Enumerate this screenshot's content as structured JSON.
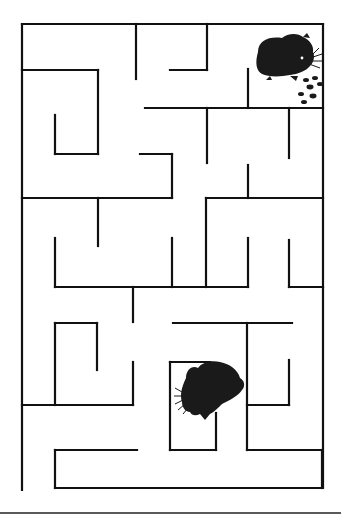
{
  "puzzle": {
    "type": "maze",
    "title": "",
    "wall_color": "#111111",
    "background": "#ffffff",
    "characters": [
      {
        "name": "hamster-with-food",
        "position": "top-right",
        "icon": "hamster-icon"
      },
      {
        "name": "hamster-seeking",
        "position": "bottom-center",
        "icon": "hamster-icon"
      }
    ],
    "food": {
      "name": "food-pellets",
      "icon": "food-pellets-icon",
      "count": 7
    }
  },
  "walls": [
    [
      22,
      24,
      323,
      24
    ],
    [
      22,
      24,
      22,
      490
    ],
    [
      323,
      24,
      323,
      488
    ],
    [
      136,
      24,
      136,
      79
    ],
    [
      207,
      24,
      207,
      70
    ],
    [
      170,
      70,
      207,
      70
    ],
    [
      22,
      70,
      98,
      70
    ],
    [
      98,
      70,
      98,
      154
    ],
    [
      55,
      115,
      55,
      154
    ],
    [
      55,
      154,
      98,
      154
    ],
    [
      145,
      108,
      323,
      108
    ],
    [
      248,
      69,
      248,
      108
    ],
    [
      207,
      108,
      207,
      163
    ],
    [
      289,
      108,
      289,
      158
    ],
    [
      140,
      154,
      172,
      154
    ],
    [
      172,
      154,
      172,
      198
    ],
    [
      248,
      165,
      248,
      198
    ],
    [
      22,
      198,
      172,
      198
    ],
    [
      98,
      198,
      98,
      246
    ],
    [
      206,
      198,
      323,
      198
    ],
    [
      206,
      198,
      206,
      287
    ],
    [
      55,
      238,
      55,
      287
    ],
    [
      55,
      287,
      248,
      287
    ],
    [
      172,
      238,
      172,
      287
    ],
    [
      248,
      238,
      248,
      287
    ],
    [
      289,
      240,
      289,
      287
    ],
    [
      289,
      287,
      323,
      287
    ],
    [
      133,
      287,
      133,
      322
    ],
    [
      55,
      323,
      97,
      323
    ],
    [
      55,
      323,
      55,
      405
    ],
    [
      97,
      323,
      97,
      370
    ],
    [
      133,
      362,
      133,
      405
    ],
    [
      22,
      405,
      133,
      405
    ],
    [
      173,
      323,
      292,
      323
    ],
    [
      247,
      323,
      247,
      450
    ],
    [
      247,
      405,
      289,
      405
    ],
    [
      289,
      360,
      289,
      405
    ],
    [
      170,
      362,
      210,
      362
    ],
    [
      170,
      362,
      170,
      450
    ],
    [
      170,
      450,
      216,
      450
    ],
    [
      216,
      413,
      216,
      450
    ],
    [
      247,
      450,
      322,
      450
    ],
    [
      55,
      450,
      137,
      450
    ],
    [
      55,
      450,
      55,
      488
    ],
    [
      55,
      488,
      322,
      488
    ],
    [
      322,
      450,
      322,
      488
    ]
  ],
  "footer_rule": {
    "y": 513
  }
}
